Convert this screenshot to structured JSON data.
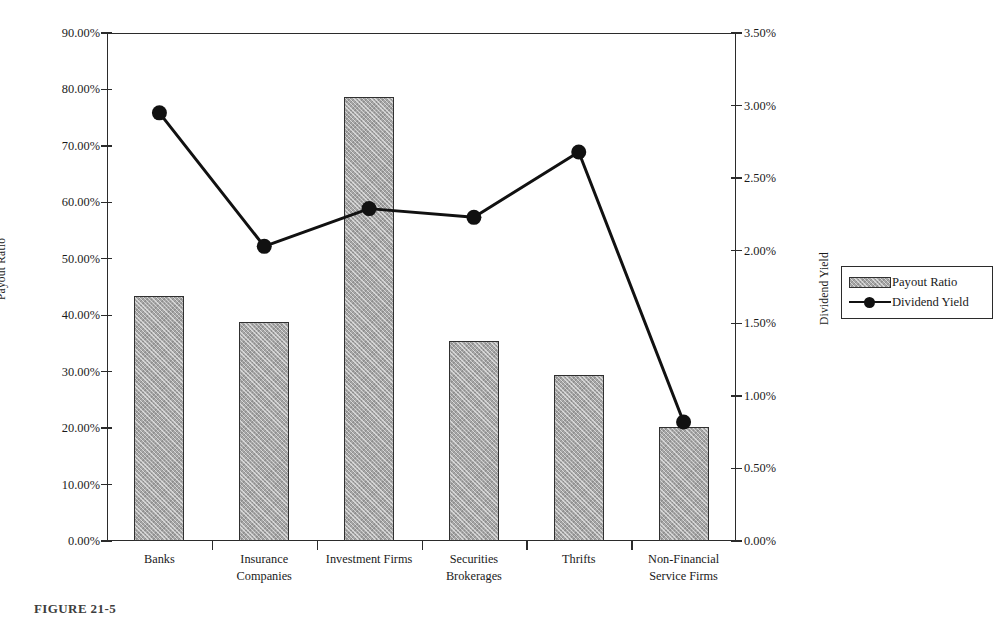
{
  "chart_data": {
    "type": "bar",
    "title": "",
    "categories": [
      "Banks",
      "Insurance Companies",
      "Investment Firms",
      "Securities Brokerages",
      "Thrifts",
      "Non-Financial Service Firms"
    ],
    "category_lines": [
      [
        "Banks"
      ],
      [
        "Insurance",
        "Companies"
      ],
      [
        "Investment Firms"
      ],
      [
        "Securities Brokerages"
      ],
      [
        "Thrifts"
      ],
      [
        "Non-Financial",
        "Service Firms"
      ]
    ],
    "xlabel": "",
    "ylabel": "Payout Ratio",
    "y2label": "Dividend Yield",
    "ylim": [
      0,
      90
    ],
    "y2lim": [
      0,
      3.5
    ],
    "grid": false,
    "legend_position": "right",
    "series": [
      {
        "name": "Payout Ratio",
        "type": "bar",
        "axis": "left",
        "values": [
          43.4,
          38.8,
          78.7,
          35.4,
          29.5,
          20.2
        ]
      },
      {
        "name": "Dividend Yield",
        "type": "line",
        "axis": "right",
        "values": [
          2.95,
          2.03,
          2.29,
          2.23,
          2.68,
          0.82
        ]
      }
    ],
    "yticks": [
      0,
      10,
      20,
      30,
      40,
      50,
      60,
      70,
      80,
      90
    ],
    "ytick_labels": [
      "0.00%",
      "10.00%",
      "20.00%",
      "30.00%",
      "40.00%",
      "50.00%",
      "60.00%",
      "70.00%",
      "80.00%",
      "90.00%"
    ],
    "y2ticks": [
      0,
      0.5,
      1.0,
      1.5,
      2.0,
      2.5,
      3.0,
      3.5
    ],
    "y2tick_labels": [
      "0.00%",
      "0.50%",
      "1.00%",
      "1.50%",
      "2.00%",
      "2.50%",
      "3.00%",
      "3.50%"
    ]
  },
  "legend": {
    "items": [
      {
        "label": "Payout Ratio",
        "marker": "hatched-bar-swatch"
      },
      {
        "label": "Dividend Yield",
        "marker": "line-with-circle-marker"
      }
    ]
  },
  "caption": {
    "text": "FIGURE 21-5"
  },
  "colors": {
    "bar_fill": "#a6a6a6",
    "bar_stroke": "#303030",
    "line": "#111111",
    "axis": "#2b2b2b",
    "background": "#ffffff",
    "text": "#1a1a1a"
  }
}
